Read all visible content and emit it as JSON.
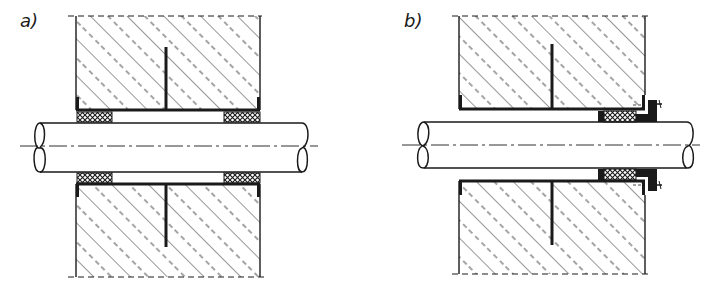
{
  "figure": {
    "panels": [
      {
        "id": "a",
        "label": "a)",
        "description": "Pipe passing through wall sleeve with packing at both ends"
      },
      {
        "id": "b",
        "label": "b)",
        "description": "Pipe passing through wall sleeve with gland packing and bolted flange on one side"
      }
    ],
    "colors": {
      "line": "#1a1a1a",
      "background": "#ffffff",
      "packing": "#1a1a1a"
    }
  }
}
